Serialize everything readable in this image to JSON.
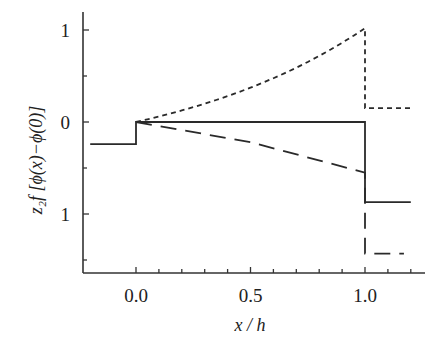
{
  "chart_data": {
    "type": "line",
    "title": "",
    "xlabel": "x / h",
    "ylabel": "z₂f [ϕ(x)−ϕ(0)]",
    "xlim": [
      -0.22,
      1.25
    ],
    "ylim": [
      -1.63,
      1.2
    ],
    "x_ticks": [
      0.0,
      0.5,
      1.0
    ],
    "x_tick_labels": [
      "0.0",
      "0.5",
      "1.0"
    ],
    "x_minor_step": 0.1,
    "y_ticks": [
      1,
      0,
      -1
    ],
    "y_tick_labels": [
      "1",
      "0",
      "1"
    ],
    "y_minor_step": 0.5,
    "grid": false,
    "legend": null,
    "series": [
      {
        "name": "solid",
        "style": "solid",
        "x": [
          -0.2,
          0.0,
          0.0,
          1.0,
          1.0,
          1.2
        ],
        "y": [
          -0.24,
          -0.24,
          0.0,
          0.0,
          -0.87,
          -0.87
        ]
      },
      {
        "name": "short-dashed",
        "style": "short-dash",
        "x": [
          0.0,
          0.25,
          0.5,
          0.75,
          1.0,
          1.0,
          1.2
        ],
        "y": [
          0.0,
          0.16,
          0.35,
          0.64,
          1.02,
          0.15,
          0.15
        ]
      },
      {
        "name": "long-dashed",
        "style": "long-dash",
        "x": [
          0.0,
          0.5,
          1.0,
          1.0,
          1.17
        ],
        "y": [
          0.0,
          -0.22,
          -0.55,
          -1.43,
          -1.43
        ]
      }
    ]
  }
}
